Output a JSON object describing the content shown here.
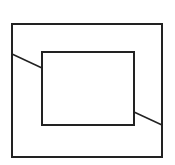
{
  "diagram": {
    "stroke_color": "#222222",
    "background": "#ffffff",
    "outer_rect": {
      "x": 12,
      "y": 24,
      "width": 150,
      "height": 133
    },
    "inner_rect": {
      "x": 42,
      "y": 52,
      "width": 92,
      "height": 73
    },
    "lines": [
      {
        "x1": 12,
        "y1": 54,
        "x2": 42,
        "y2": 68
      },
      {
        "x1": 134,
        "y1": 112,
        "x2": 162,
        "y2": 125
      }
    ]
  }
}
